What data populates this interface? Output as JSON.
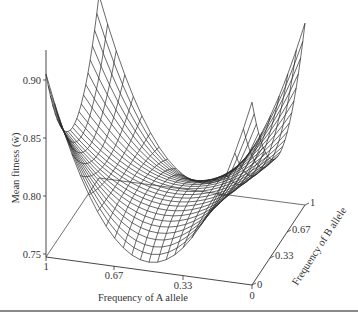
{
  "chart_data": {
    "type": "surface3d",
    "title": "",
    "zlabel": "Mean fitness (w̄)",
    "xlabel": "Frequency of A allele",
    "ylabel": "Frequency of B allele",
    "zlim": [
      0.75,
      0.92
    ],
    "z_ticks": [
      "0.90",
      "0.85",
      "0.80",
      "0.75"
    ],
    "x_ticks": [
      "1",
      "0.67",
      "0.33",
      "0"
    ],
    "y_ticks": [
      "0",
      "0.33",
      "0.67",
      "1"
    ],
    "grid": false,
    "surface_samples": [
      {
        "pA": 1,
        "pB": 0,
        "w": 0.9
      },
      {
        "pA": 0.5,
        "pB": 0,
        "w": 0.75
      },
      {
        "pA": 0,
        "pB": 0,
        "w": 0.9
      },
      {
        "pA": 1,
        "pB": 1,
        "w": 0.9
      },
      {
        "pA": 0,
        "pB": 1,
        "w": 0.9
      },
      {
        "pA": 0.5,
        "pB": 0.5,
        "w": 0.85
      },
      {
        "pA": 1,
        "pB": 0.5,
        "w": 0.88
      },
      {
        "pA": 0.5,
        "pB": 1,
        "w": 0.88
      }
    ],
    "mesh_resolution": 24,
    "line_color": "#2a2a2a"
  },
  "labels": {
    "z_axis_title": "Mean fitness (w̄)",
    "x_axis_title": "Frequency of A allele",
    "y_axis_title": "Frequency of B allele"
  }
}
